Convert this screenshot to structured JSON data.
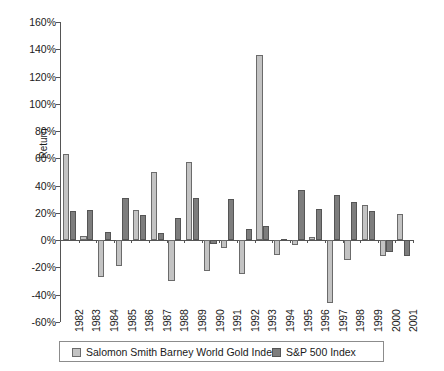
{
  "chart_data": {
    "type": "bar",
    "title": "",
    "subtitle": "",
    "xlabel": "",
    "ylabel": "Return",
    "ylim": [
      -60,
      160
    ],
    "ytick_step": 20,
    "ytick_labels": [
      "160%",
      "140%",
      "120%",
      "100%",
      "80%",
      "60%",
      "40%",
      "20%",
      "0%",
      "-20%",
      "-40%",
      "-60%"
    ],
    "ytick_values": [
      160,
      140,
      120,
      100,
      80,
      60,
      40,
      20,
      0,
      -20,
      -40,
      -60
    ],
    "grid": false,
    "legend_position": "bottom",
    "categories": [
      "1982",
      "1983",
      "1984",
      "1985",
      "1986",
      "1987",
      "1988",
      "1989",
      "1990",
      "1991",
      "1992",
      "1993",
      "1994",
      "1995",
      "1996",
      "1997",
      "1998",
      "1999",
      "2000",
      "2001"
    ],
    "series": [
      {
        "name": "Salomon Smith Barney World Gold Index",
        "color": "#c3c3c3",
        "values": [
          63,
          3,
          -27,
          -19,
          22,
          50,
          -30,
          57,
          -23,
          -6,
          -25,
          136,
          -11,
          -4,
          2,
          -46,
          -15,
          26,
          -12,
          19
        ]
      },
      {
        "name": "S&P 500 Index",
        "color": "#7d7d7d",
        "values": [
          21,
          22,
          6,
          31,
          18,
          5,
          16,
          31,
          -3,
          30,
          8,
          10,
          1,
          37,
          23,
          33,
          28,
          21,
          -9,
          -12
        ]
      }
    ]
  },
  "legend": {
    "items": [
      {
        "label": "Salomon Smith Barney World Gold Index",
        "swatch": "gold"
      },
      {
        "label": "S&P 500 Index",
        "swatch": "snp"
      }
    ]
  },
  "axis": {
    "y_title": "Return"
  }
}
